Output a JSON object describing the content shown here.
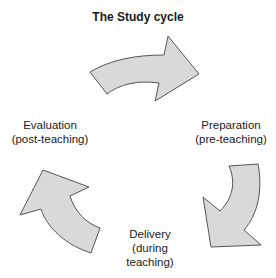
{
  "diagram": {
    "title": "The Study cycle",
    "type": "cycle",
    "stages": [
      {
        "id": "preparation",
        "line1": "Preparation",
        "line2": "(pre-teaching)"
      },
      {
        "id": "delivery",
        "line1": "Delivery",
        "line2": "(during",
        "line3": "teaching)"
      },
      {
        "id": "evaluation",
        "line1": "Evaluation",
        "line2": "(post-teaching)"
      }
    ],
    "arrows": [
      {
        "from": "evaluation",
        "to": "preparation",
        "direction": "clockwise-top"
      },
      {
        "from": "preparation",
        "to": "delivery",
        "direction": "clockwise-right"
      },
      {
        "from": "delivery",
        "to": "evaluation",
        "direction": "clockwise-left"
      }
    ],
    "colors": {
      "arrow_fill": "#d9d9d9",
      "arrow_stroke": "#555555",
      "text": "#1a1a1a",
      "background": "#ffffff"
    }
  }
}
